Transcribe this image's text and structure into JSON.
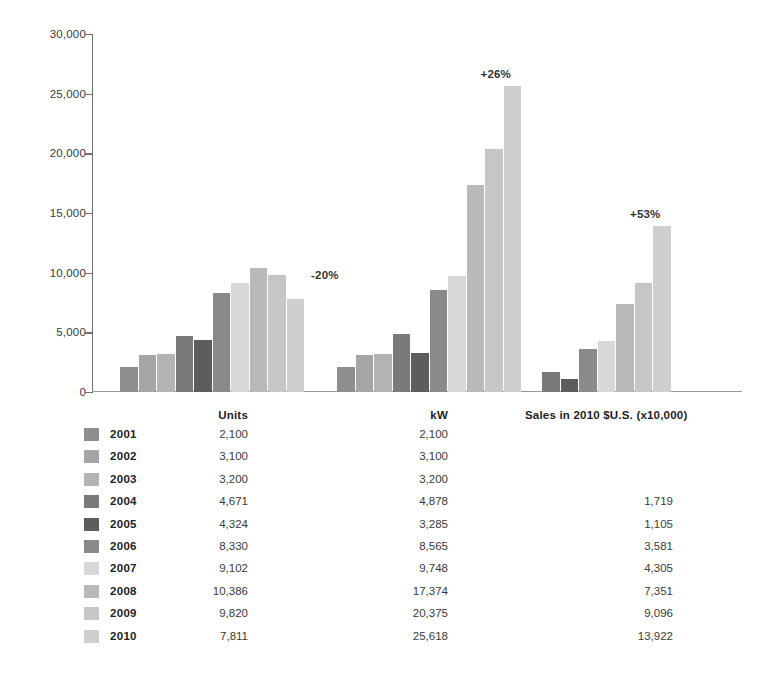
{
  "chart_data": {
    "type": "bar",
    "title": "",
    "xlabel": "",
    "ylabel": "",
    "ylim": [
      0,
      30000
    ],
    "grid": false,
    "legend_position": "below-as-table",
    "y_ticks": [
      0,
      5000,
      10000,
      15000,
      20000,
      25000,
      30000
    ],
    "y_tick_labels": [
      "0",
      "5,000",
      "10,000",
      "15,000",
      "20,000",
      "25,000",
      "30,000"
    ],
    "categories": [
      "Units",
      "kW",
      "Sales in 2010 $U.S. (x10,000)"
    ],
    "group_labels": [
      "Units",
      "kW",
      "Sales in 2010 $U.S. (x10,000)"
    ],
    "group_annotations": [
      "-20%",
      "+26%",
      "+53%"
    ],
    "series": [
      {
        "name": "2001",
        "color": "#8e8e8e",
        "values": [
          2100,
          2100,
          null
        ]
      },
      {
        "name": "2002",
        "color": "#a5a5a5",
        "values": [
          3100,
          3100,
          null
        ]
      },
      {
        "name": "2003",
        "color": "#b4b4b4",
        "values": [
          3200,
          3200,
          null
        ]
      },
      {
        "name": "2004",
        "color": "#7a7a7a",
        "values": [
          4671,
          4878,
          1719
        ]
      },
      {
        "name": "2005",
        "color": "#5d5d5d",
        "values": [
          4324,
          3285,
          1105
        ]
      },
      {
        "name": "2006",
        "color": "#8a8a8a",
        "values": [
          8330,
          8565,
          3581
        ]
      },
      {
        "name": "2007",
        "color": "#d8d8d8",
        "values": [
          9102,
          9748,
          4305
        ]
      },
      {
        "name": "2008",
        "color": "#b9b9b9",
        "values": [
          10386,
          17374,
          7351
        ]
      },
      {
        "name": "2009",
        "color": "#c6c6c6",
        "values": [
          9820,
          20375,
          9096
        ]
      },
      {
        "name": "2010",
        "color": "#cfcfcf",
        "values": [
          7811,
          25618,
          13922
        ]
      }
    ]
  },
  "legend_table": {
    "headers": {
      "units": "Units",
      "kw": "kW",
      "sales": "Sales in 2010 $U.S. (x10,000)"
    },
    "rows": [
      {
        "year": "2001",
        "units": "2,100",
        "kw": "2,100",
        "sales": ""
      },
      {
        "year": "2002",
        "units": "3,100",
        "kw": "3,100",
        "sales": ""
      },
      {
        "year": "2003",
        "units": "3,200",
        "kw": "3,200",
        "sales": ""
      },
      {
        "year": "2004",
        "units": "4,671",
        "kw": "4,878",
        "sales": "1,719"
      },
      {
        "year": "2005",
        "units": "4,324",
        "kw": "3,285",
        "sales": "1,105"
      },
      {
        "year": "2006",
        "units": "8,330",
        "kw": "8,565",
        "sales": "3,581"
      },
      {
        "year": "2007",
        "units": "9,102",
        "kw": "9,748",
        "sales": "4,305"
      },
      {
        "year": "2008",
        "units": "10,386",
        "kw": "17,374",
        "sales": "7,351"
      },
      {
        "year": "2009",
        "units": "9,820",
        "kw": "20,375",
        "sales": "9,096"
      },
      {
        "year": "2010",
        "units": "7,811",
        "kw": "25,618",
        "sales": "13,922"
      }
    ]
  }
}
